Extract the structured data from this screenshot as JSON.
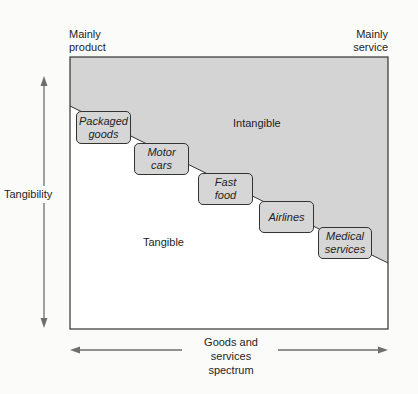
{
  "diagram": {
    "title": "",
    "corners": {
      "top_left": [
        "Mainly",
        "product"
      ],
      "top_right": [
        "Mainly",
        "service"
      ]
    },
    "regions": {
      "upper": "Intangible",
      "lower": "Tangible"
    },
    "axes": {
      "vertical": "Tangibility",
      "horizontal": [
        "Goods and",
        "services",
        "spectrum"
      ]
    },
    "categories": [
      {
        "line1": "Packaged",
        "line2": "goods"
      },
      {
        "line1": "Motor",
        "line2": "cars"
      },
      {
        "line1": "Fast",
        "line2": "food"
      },
      {
        "line1": "Airlines",
        "line2": ""
      },
      {
        "line1": "Medical",
        "line2": "services"
      }
    ],
    "colors": {
      "intangible_fill": "#d4d4d4",
      "tangible_fill": "#ffffff",
      "box_fill": "#d6d6d6",
      "line": "#333333",
      "arrow": "#6e6e6e"
    }
  }
}
